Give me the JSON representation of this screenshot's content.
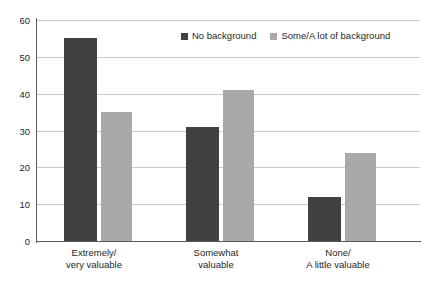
{
  "chart_data": {
    "type": "bar",
    "title": "",
    "subtitle": "",
    "xlabel": "",
    "ylabel": "",
    "ylim": [
      0,
      60
    ],
    "yticks": [
      0,
      10,
      20,
      30,
      40,
      50,
      60
    ],
    "ytick_labels": [
      "0",
      "10",
      "20",
      "30",
      "40",
      "50",
      "60"
    ],
    "grid": true,
    "legend_position": "top-center",
    "categories": [
      "Extremely/\nvery valuable",
      "Somewhat\nvaluable",
      "None/\nA little valuable"
    ],
    "category_lines": [
      [
        "Extremely/",
        "very valuable"
      ],
      [
        "Somewhat",
        "valuable"
      ],
      [
        "None/",
        "A little valuable"
      ]
    ],
    "series": [
      {
        "name": "No background",
        "color": "#414141",
        "values": [
          55,
          31,
          12
        ]
      },
      {
        "name": "Some/A lot of background",
        "color": "#a9a9a9",
        "values": [
          35,
          41,
          24
        ]
      }
    ]
  },
  "colors": {
    "series_dark": "#414141",
    "series_light": "#a9a9a9",
    "gridline": "#c9c9c9",
    "axis": "#5a5a5a",
    "text": "#1f1f1f",
    "background": "#ffffff"
  }
}
